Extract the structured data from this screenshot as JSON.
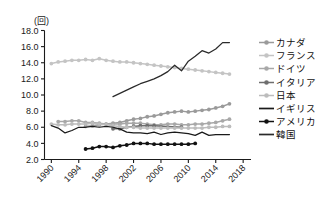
{
  "chart_data": {
    "type": "line",
    "title": "",
    "subtitle": "",
    "unit_label": "(回)",
    "xlabel": "",
    "ylabel": "",
    "xlim": [
      1989,
      2019
    ],
    "ylim": [
      2.0,
      18.0
    ],
    "grid": false,
    "legend_position": "right",
    "y_ticks": [
      "18.0",
      "16.0",
      "14.0",
      "12.0",
      "10.0",
      "8.0",
      "6.0",
      "4.0",
      "2.0"
    ],
    "y_tick_values": [
      18.0,
      16.0,
      14.0,
      12.0,
      10.0,
      8.0,
      6.0,
      4.0,
      2.0
    ],
    "x_ticks": [
      "1990",
      "1994",
      "1998",
      "2002",
      "2006",
      "2010",
      "2014",
      "2018"
    ],
    "x_tick_values": [
      1990,
      1994,
      1998,
      2002,
      2006,
      2010,
      2014,
      2018
    ],
    "series": [
      {
        "name": "カナダ",
        "color": "#9a9a9a",
        "marker": "circle",
        "x": [
          1995,
          1996,
          1997,
          1998,
          1999,
          2000,
          2001,
          2002,
          2003,
          2004,
          2005,
          2006,
          2007,
          2008,
          2009,
          2010,
          2011,
          2012,
          2013,
          2014,
          2015,
          2016
        ],
        "values": [
          6.1,
          6.2,
          6.3,
          6.4,
          6.5,
          6.6,
          6.8,
          7.0,
          7.1,
          7.3,
          7.4,
          7.6,
          7.8,
          7.9,
          8.0,
          7.9,
          8.0,
          8.1,
          8.2,
          8.4,
          8.6,
          8.9
        ]
      },
      {
        "name": "フランス",
        "color": "#c4c4c4",
        "marker": "circle",
        "x": [
          1990,
          1991,
          1992,
          1993,
          1994,
          1995,
          1996,
          1997,
          1998,
          1999,
          2000,
          2001,
          2002,
          2003,
          2004,
          2005,
          2006,
          2007,
          2008,
          2009,
          2010,
          2011,
          2012,
          2013,
          2014,
          2015,
          2016
        ],
        "values": [
          13.9,
          14.1,
          14.2,
          14.3,
          14.3,
          14.4,
          14.3,
          14.5,
          14.3,
          14.2,
          14.1,
          14.1,
          14.0,
          13.9,
          13.8,
          13.7,
          13.6,
          13.5,
          13.4,
          13.3,
          13.2,
          13.1,
          13.0,
          12.9,
          12.8,
          12.7,
          12.6
        ]
      },
      {
        "name": "ドイツ",
        "color": "#a8a8a8",
        "marker": "circle",
        "x": [
          1991,
          1992,
          1993,
          1994,
          1995,
          1996,
          1997,
          1998,
          1999,
          2000,
          2001,
          2002,
          2003,
          2004,
          2005,
          2006,
          2007,
          2008,
          2009,
          2010,
          2011,
          2012,
          2013,
          2014,
          2015,
          2016
        ],
        "values": [
          6.7,
          6.7,
          6.8,
          6.8,
          6.6,
          6.6,
          6.5,
          6.4,
          6.4,
          6.4,
          6.5,
          6.5,
          6.5,
          6.4,
          6.3,
          6.3,
          6.4,
          6.4,
          6.3,
          6.3,
          6.4,
          6.4,
          6.5,
          6.6,
          6.8,
          7.0
        ]
      },
      {
        "name": "イタリア",
        "color": "#6e6e6e",
        "marker": "circle",
        "x": [
          1999,
          2000,
          2001,
          2002,
          2003,
          2004,
          2005,
          2009
        ],
        "values": [
          5.8,
          5.8,
          6.0,
          6.1,
          6.2,
          6.2,
          6.2,
          6.0
        ]
      },
      {
        "name": "日本",
        "color": "#bcbcbc",
        "marker": "circle",
        "x": [
          1990,
          1991,
          1992,
          1993,
          1994,
          1995,
          1996,
          1997,
          1998,
          1999,
          2000,
          2001,
          2002,
          2003,
          2004,
          2005,
          2006,
          2007,
          2008,
          2009,
          2010,
          2011,
          2012,
          2013,
          2014,
          2015,
          2016
        ],
        "values": [
          6.4,
          6.3,
          6.3,
          6.4,
          6.4,
          6.4,
          6.5,
          6.4,
          6.3,
          6.2,
          6.1,
          6.0,
          6.0,
          5.9,
          5.9,
          5.9,
          5.9,
          5.9,
          5.9,
          5.9,
          5.9,
          5.9,
          5.9,
          6.0,
          6.0,
          6.1,
          6.1
        ]
      },
      {
        "name": "イギリス",
        "color": "#1a1a1a",
        "marker": "none",
        "x": [
          1990,
          1991,
          1992,
          1993,
          1994,
          1995,
          1996,
          1997,
          1998,
          1999,
          2000,
          2001,
          2002,
          2003,
          2004,
          2005,
          2006,
          2007,
          2008,
          2009,
          2010,
          2011,
          2012,
          2013,
          2014,
          2015,
          2016
        ],
        "values": [
          6.2,
          5.9,
          5.3,
          5.6,
          6.0,
          6.0,
          6.1,
          6.0,
          6.1,
          6.0,
          5.8,
          5.4,
          5.3,
          5.3,
          5.2,
          5.4,
          5.1,
          5.3,
          5.4,
          5.3,
          5.2,
          5.0,
          5.4,
          5.0,
          5.1,
          5.1,
          5.1
        ]
      },
      {
        "name": "アメリカ",
        "color": "#111111",
        "marker": "circle",
        "x": [
          1995,
          1996,
          1997,
          1998,
          1999,
          2000,
          2001,
          2002,
          2003,
          2004,
          2005,
          2006,
          2007,
          2008,
          2009,
          2010,
          2011
        ],
        "values": [
          3.3,
          3.4,
          3.6,
          3.6,
          3.5,
          3.7,
          3.8,
          4.0,
          4.0,
          4.0,
          3.9,
          3.9,
          3.9,
          3.9,
          3.9,
          3.9,
          4.0
        ]
      },
      {
        "name": "韓国",
        "color": "#2a2a2a",
        "marker": "none",
        "x": [
          1999,
          2000,
          2001,
          2002,
          2003,
          2004,
          2005,
          2006,
          2007,
          2008,
          2009,
          2010,
          2011,
          2012,
          2013,
          2014,
          2015,
          2016
        ],
        "values": [
          9.8,
          10.2,
          10.6,
          11.0,
          11.4,
          11.7,
          12.0,
          12.4,
          12.9,
          13.7,
          13.0,
          14.2,
          14.8,
          15.5,
          15.2,
          15.7,
          16.5,
          16.5
        ]
      }
    ]
  },
  "legend": {
    "items": [
      {
        "label": "カナダ",
        "color": "#9a9a9a",
        "marker": "circle",
        "icon": "legend-marker-circle-icon"
      },
      {
        "label": "フランス",
        "color": "#c4c4c4",
        "marker": "circle",
        "icon": "legend-marker-circle-icon"
      },
      {
        "label": "ドイツ",
        "color": "#a8a8a8",
        "marker": "circle",
        "icon": "legend-marker-circle-icon"
      },
      {
        "label": "イタリア",
        "color": "#6e6e6e",
        "marker": "circle",
        "icon": "legend-marker-circle-icon"
      },
      {
        "label": "日本",
        "color": "#bcbcbc",
        "marker": "circle",
        "icon": "legend-marker-circle-icon"
      },
      {
        "label": "イギリス",
        "color": "#1a1a1a",
        "marker": "none",
        "icon": "legend-marker-line-icon"
      },
      {
        "label": "アメリカ",
        "color": "#111111",
        "marker": "circle",
        "icon": "legend-marker-circle-icon"
      },
      {
        "label": "韓国",
        "color": "#2a2a2a",
        "marker": "none",
        "icon": "legend-marker-line-icon"
      }
    ]
  }
}
